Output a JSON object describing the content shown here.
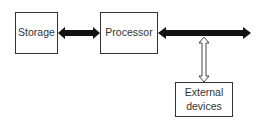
{
  "diagram": {
    "nodes": [
      {
        "id": "storage",
        "label": "Storage"
      },
      {
        "id": "processor",
        "label": "Processor"
      },
      {
        "id": "external",
        "label": "External\ndevices",
        "line1": "External",
        "line2": "devices"
      }
    ],
    "edges": [
      {
        "from": "storage",
        "to": "processor",
        "style": "solid bidirectional"
      },
      {
        "from": "processor",
        "to": "bus",
        "style": "solid bidirectional"
      },
      {
        "from": "bus",
        "to": "external",
        "style": "hollow bidirectional"
      }
    ],
    "colors": {
      "stroke": "#333333",
      "fill": "#111111",
      "background": "#ffffff"
    }
  }
}
